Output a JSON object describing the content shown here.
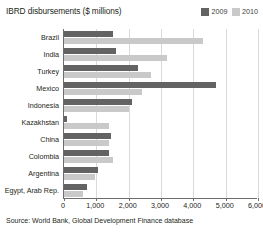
{
  "chart_data": {
    "type": "bar",
    "orientation": "horizontal",
    "title": "IBRD disbursements ($ millions)",
    "xlabel": "",
    "ylabel": "",
    "xlim": [
      0,
      6000
    ],
    "xticks": [
      0,
      1000,
      2000,
      3000,
      4000,
      5000,
      6000
    ],
    "xtick_labels": [
      "0",
      "1,000",
      "2,000",
      "3,000",
      "4,000",
      "5,000",
      "6,000"
    ],
    "grid": true,
    "grid_axis": "x",
    "legend_position": "top-right",
    "categories": [
      "Brazil",
      "India",
      "Turkey",
      "Mexico",
      "Indonesia",
      "Kazakhstan",
      "China",
      "Colombia",
      "Argentina",
      "Egypt, Arab Rep."
    ],
    "series": [
      {
        "name": "2009",
        "color": "#636363",
        "values": [
          1500,
          1600,
          2300,
          4700,
          2100,
          100,
          1450,
          1400,
          1050,
          700
        ]
      },
      {
        "name": "2010",
        "color": "#c9c9c9",
        "values": [
          4300,
          3200,
          2700,
          2400,
          2000,
          1400,
          1400,
          1500,
          950,
          600
        ]
      }
    ],
    "source": "Source: World Bank, Global Development Finance database"
  },
  "axis": {
    "line_color": "#6d6d6d",
    "grid_color": "#d9d9d9"
  }
}
